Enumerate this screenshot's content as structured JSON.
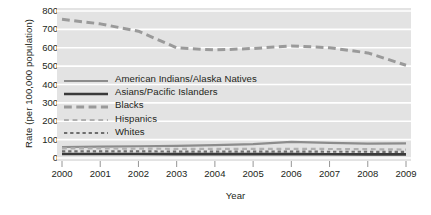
{
  "chart_data": {
    "type": "line",
    "title": "",
    "xlabel": "Year",
    "ylabel": "Rate (per 100,000 population)",
    "x": [
      2000,
      2001,
      2002,
      2003,
      2004,
      2005,
      2006,
      2007,
      2008,
      2009
    ],
    "xticklabels": [
      "2000",
      "2001",
      "2002",
      "2003",
      "2004",
      "2005",
      "2006",
      "2007",
      "2008",
      "2009"
    ],
    "yticklabels": [
      "0",
      "100",
      "200",
      "300",
      "400",
      "500",
      "600",
      "700",
      "800"
    ],
    "yticks": [
      0,
      100,
      200,
      300,
      400,
      500,
      600,
      700,
      800
    ],
    "ylim": [
      0,
      800
    ],
    "xlim": [
      2000,
      2009
    ],
    "grid": "horizontal-white",
    "legend_position": "inside-upper-left",
    "plot_background": "#e3e3e3",
    "series": [
      {
        "name": "American Indians/Alaska Natives",
        "values": [
          60,
          62,
          64,
          66,
          70,
          75,
          88,
          82,
          78,
          80
        ],
        "color": "#8c8c8c",
        "style": "solid",
        "width": 2.2
      },
      {
        "name": "Asians/Pacific Islanders",
        "values": [
          22,
          22,
          22,
          21,
          21,
          21,
          21,
          20,
          20,
          20
        ],
        "color": "#3a3a3a",
        "style": "solid",
        "width": 2.6
      },
      {
        "name": "Blacks",
        "values": [
          755,
          730,
          690,
          600,
          588,
          596,
          610,
          600,
          572,
          505
        ],
        "color": "#9a9a9a",
        "style": "dashed-long",
        "width": 3.0
      },
      {
        "name": "Hispanics",
        "values": [
          52,
          52,
          51,
          50,
          50,
          50,
          50,
          49,
          48,
          46
        ],
        "color": "#b0b0b0",
        "style": "dashed-medium",
        "width": 2.2
      },
      {
        "name": "Whites",
        "values": [
          36,
          36,
          36,
          35,
          35,
          35,
          35,
          34,
          34,
          33
        ],
        "color": "#6e6e6e",
        "style": "dashed-short",
        "width": 2.2
      }
    ]
  },
  "legend": {
    "items": [
      {
        "label": "American Indians/Alaska Natives"
      },
      {
        "label": "Asians/Pacific Islanders"
      },
      {
        "label": "Blacks"
      },
      {
        "label": "Hispanics"
      },
      {
        "label": "Whites"
      }
    ]
  }
}
